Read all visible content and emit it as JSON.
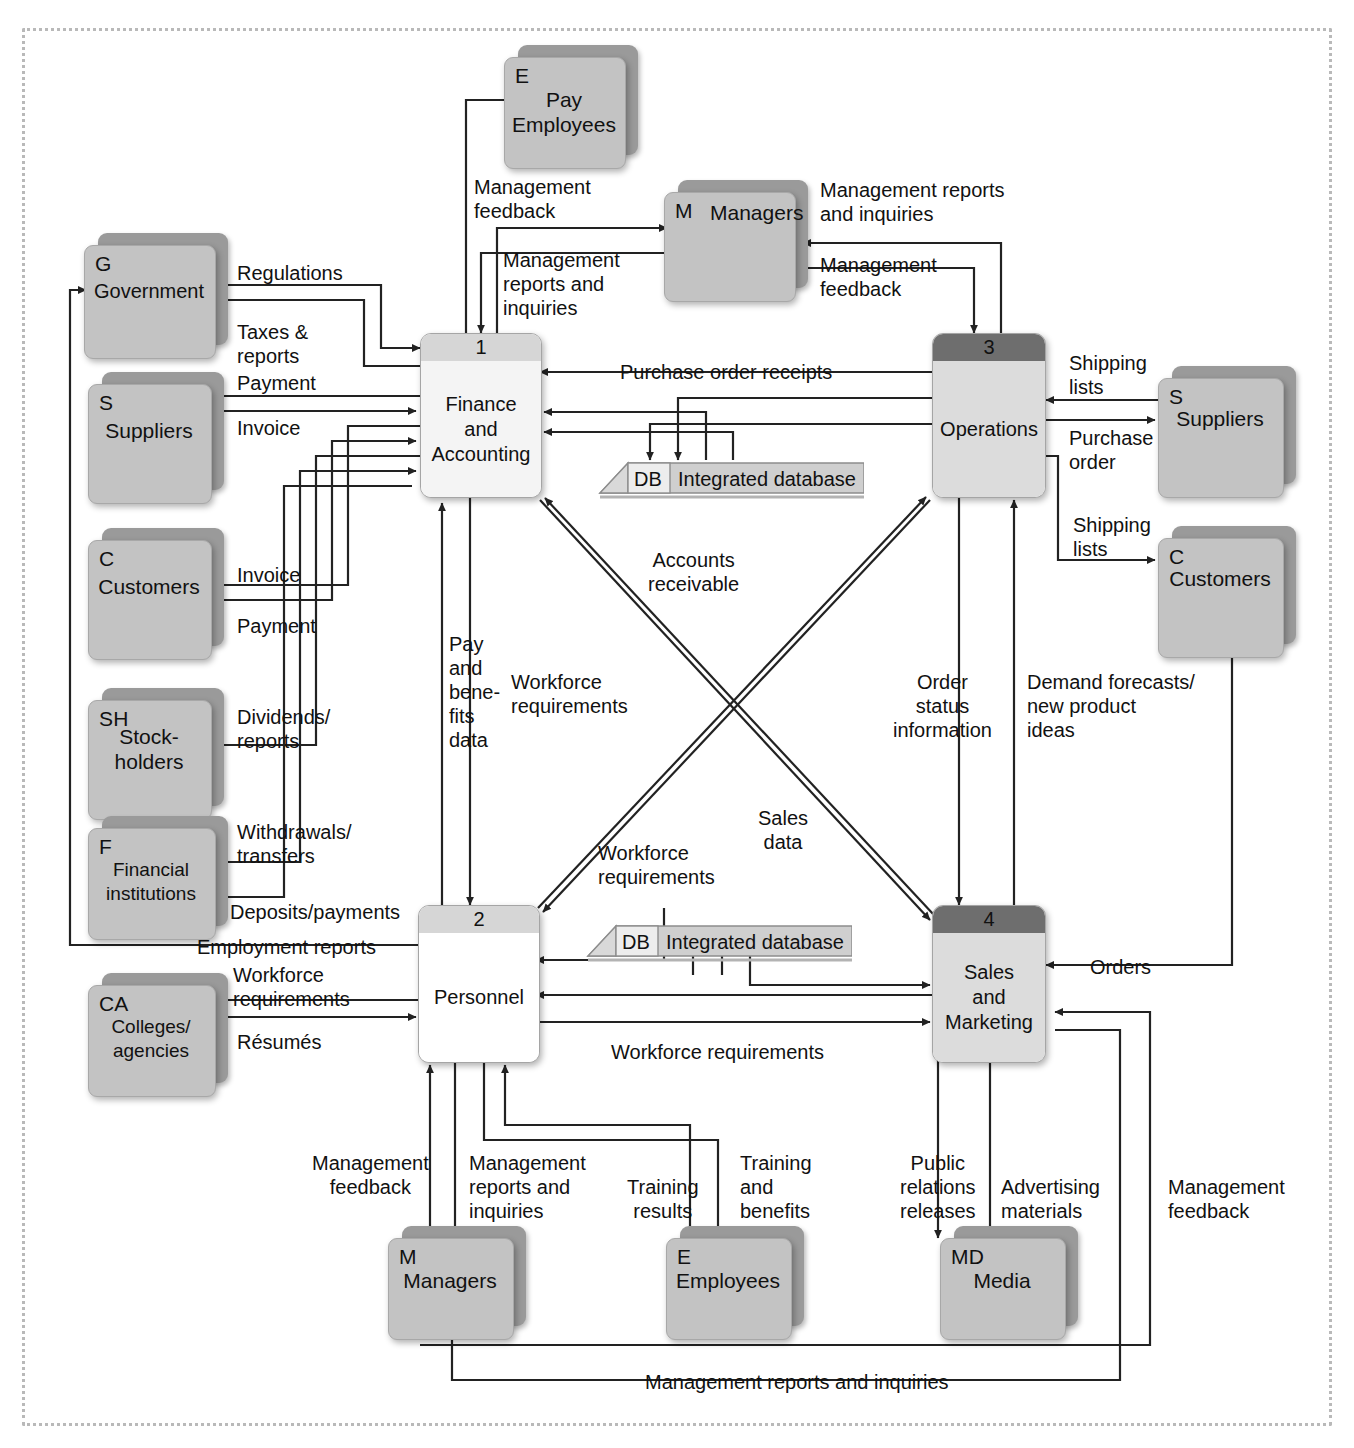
{
  "diagram": {
    "type": "data-flow-diagram",
    "colors": {
      "entity_fill": "#c3c3c3",
      "entity_shadow": "#9a9a9a",
      "process_fill": "#ffffff",
      "process_header_light": "#d6d6d6",
      "process_header_dark": "#6e6e6e",
      "store_fill": "#c8c8c8",
      "line": "#222222",
      "frame": "#b9b9b9"
    }
  },
  "processes": [
    {
      "number": "1",
      "name": "Finance\nand\nAccounting",
      "header_shade": "light"
    },
    {
      "number": "2",
      "name": "Personnel",
      "header_shade": "light"
    },
    {
      "number": "3",
      "name": "Operations",
      "header_shade": "dark"
    },
    {
      "number": "4",
      "name": "Sales\nand\nMarketing",
      "header_shade": "dark"
    }
  ],
  "entities": [
    {
      "code": "E",
      "name": "Pay\nEmployees",
      "id": "pay-employees"
    },
    {
      "code": "M",
      "name": "Managers",
      "id": "managers-top"
    },
    {
      "code": "G",
      "name": "Government",
      "id": "government"
    },
    {
      "code": "S",
      "name": "Suppliers",
      "id": "suppliers-left"
    },
    {
      "code": "C",
      "name": "Customers",
      "id": "customers-left"
    },
    {
      "code": "SH",
      "name": "Stock-\nholders",
      "id": "stockholders"
    },
    {
      "code": "F",
      "name": "Financial\ninstitutions",
      "id": "financial-institutions"
    },
    {
      "code": "CA",
      "name": "Colleges/\nagencies",
      "id": "colleges-agencies"
    },
    {
      "code": "S",
      "name": "Suppliers",
      "id": "suppliers-right"
    },
    {
      "code": "C",
      "name": "Customers",
      "id": "customers-right"
    },
    {
      "code": "M",
      "name": "Managers",
      "id": "managers-bottom"
    },
    {
      "code": "E",
      "name": "Employees",
      "id": "employees-bottom"
    },
    {
      "code": "MD",
      "name": "Media",
      "id": "media"
    }
  ],
  "stores": [
    {
      "code": "DB",
      "name": "Integrated database",
      "id": "store-top"
    },
    {
      "code": "DB",
      "name": "Integrated database",
      "id": "store-bottom"
    }
  ],
  "flow_labels": [
    {
      "id": "l-mgmt-feedback-pay",
      "text": "Management\nfeedback"
    },
    {
      "id": "l-mgmt-reports-top",
      "text": "Management reports\nand inquiries"
    },
    {
      "id": "l-mgmt-reports-1",
      "text": "Management\nreports and\ninquiries"
    },
    {
      "id": "l-mgmt-feedback-3",
      "text": "Management\nfeedback"
    },
    {
      "id": "l-regulations",
      "text": "Regulations"
    },
    {
      "id": "l-taxes-reports",
      "text": "Taxes &\nreports"
    },
    {
      "id": "l-payment-suppliers",
      "text": "Payment"
    },
    {
      "id": "l-invoice-suppliers",
      "text": "Invoice"
    },
    {
      "id": "l-invoice-customers",
      "text": "Invoice"
    },
    {
      "id": "l-payment-customers",
      "text": "Payment"
    },
    {
      "id": "l-dividends-reports",
      "text": "Dividends/\nreports"
    },
    {
      "id": "l-withdrawals-transfers",
      "text": "Withdrawals/\ntransfers"
    },
    {
      "id": "l-deposits-payments",
      "text": "Deposits/payments"
    },
    {
      "id": "l-employment-reports",
      "text": "Employment reports"
    },
    {
      "id": "l-workforce-req-ca",
      "text": "Workforce\nrequirements"
    },
    {
      "id": "l-resumes",
      "text": "Résumés"
    },
    {
      "id": "l-purchase-order-receipts",
      "text": "Purchase order receipts"
    },
    {
      "id": "l-shipping-lists-sup",
      "text": "Shipping\nlists"
    },
    {
      "id": "l-purchase-order",
      "text": "Purchase\norder"
    },
    {
      "id": "l-shipping-lists-cust",
      "text": "Shipping\nlists"
    },
    {
      "id": "l-accounts-receivable",
      "text": "Accounts\nreceivable"
    },
    {
      "id": "l-pay-benefits-data",
      "text": "Pay\nand\nbene-\nfits\ndata"
    },
    {
      "id": "l-workforce-req-1",
      "text": "Workforce\nrequirements"
    },
    {
      "id": "l-order-status",
      "text": "Order\nstatus\ninformation"
    },
    {
      "id": "l-demand-forecasts",
      "text": "Demand forecasts/\nnew product\nideas"
    },
    {
      "id": "l-workforce-req-mid",
      "text": "Workforce\nrequirements"
    },
    {
      "id": "l-sales-data",
      "text": "Sales\ndata"
    },
    {
      "id": "l-orders",
      "text": "Orders"
    },
    {
      "id": "l-workforce-req-bottom",
      "text": "Workforce requirements"
    },
    {
      "id": "l-mgmt-feedback-bottom",
      "text": "Management\nfeedback"
    },
    {
      "id": "l-mgmt-reports-bottom",
      "text": "Management\nreports and\ninquiries"
    },
    {
      "id": "l-training-results",
      "text": "Training\nresults"
    },
    {
      "id": "l-training-benefits",
      "text": "Training\nand\nbenefits"
    },
    {
      "id": "l-public-relations",
      "text": "Public\nrelations\nreleases"
    },
    {
      "id": "l-advertising-materials",
      "text": "Advertising\nmaterials"
    },
    {
      "id": "l-mgmt-feedback-sales",
      "text": "Management\nfeedback"
    },
    {
      "id": "l-mgmt-reports-footer",
      "text": "Management reports and inquiries"
    }
  ]
}
